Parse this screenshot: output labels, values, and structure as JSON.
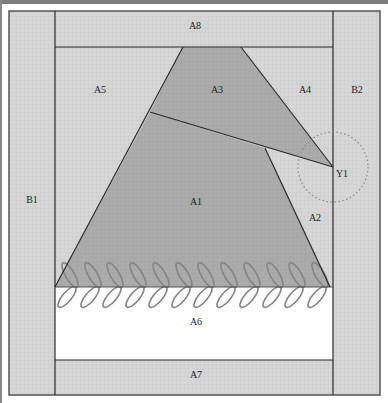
{
  "diagram": {
    "type": "quilt-block-pattern",
    "colors": {
      "light_fabric": "#d3d3d3",
      "dark_fabric": "#a9a9a9",
      "white_fabric": "#ffffff",
      "seam_line": "#2b2b2b",
      "leaf_stroke": "#858585",
      "dotted_circle": "#8a8a8a"
    },
    "labels": {
      "A1": "A1",
      "A2": "A2",
      "A3": "A3",
      "A4": "A4",
      "A5": "A5",
      "A6": "A6",
      "A7": "A7",
      "A8": "A8",
      "B1": "B1",
      "B2": "B2",
      "Y1": "Y1"
    },
    "pieces": [
      {
        "id": "B1",
        "fill": "light",
        "position": "left border strip"
      },
      {
        "id": "B2",
        "fill": "light",
        "position": "right border strip"
      },
      {
        "id": "A8",
        "fill": "light",
        "position": "top strip"
      },
      {
        "id": "A7",
        "fill": "light",
        "position": "bottom strip"
      },
      {
        "id": "A6",
        "fill": "white",
        "position": "band above A7"
      },
      {
        "id": "A5",
        "fill": "light",
        "position": "upper-left background"
      },
      {
        "id": "A4",
        "fill": "light",
        "position": "upper-right background"
      },
      {
        "id": "A3",
        "fill": "dark",
        "position": "top trapezoid"
      },
      {
        "id": "A1",
        "fill": "dark",
        "position": "main trapezoid"
      },
      {
        "id": "A2",
        "fill": "light",
        "position": "right wedge"
      }
    ],
    "annotation": {
      "point": "Y1",
      "marker": "dotted circle"
    },
    "embroidery": {
      "motif": "leaf vine",
      "leaf_pairs": 12
    }
  }
}
